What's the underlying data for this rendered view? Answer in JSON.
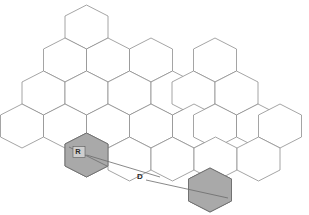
{
  "diagram": {
    "type": "cellular-frequency-reuse-hexagon-grid",
    "background_color": "#ffffff",
    "cell_outline_color": "#8e8e8e",
    "shaded_cell_color": "#a9a9a9",
    "line_color": "#6b6b6b",
    "geometry": {
      "hex_width": 43,
      "hex_height": 44,
      "column_pitch": 43,
      "row_pitch": 33,
      "row_offset": 21.5,
      "orientation": "pointy-top"
    },
    "labels": [
      {
        "id": "radius",
        "text": "R",
        "x": 78,
        "y": 152,
        "boxed": true
      },
      {
        "id": "distance",
        "text": "D",
        "x": 140,
        "y": 177,
        "boxed": false
      }
    ],
    "shaded_cells": [
      {
        "id": "reference-cell",
        "label": "R",
        "cx": 86.5,
        "cy": 155
      },
      {
        "id": "cochannel-cell",
        "label": "",
        "cx": 210,
        "cy": 190
      }
    ],
    "lines": [
      {
        "id": "radius-line",
        "name": "cell-radius-line",
        "x1": 69,
        "y1": 147,
        "x2": 107,
        "y2": 166
      },
      {
        "id": "distance-line-upper",
        "name": "reuse-distance-line-upper",
        "x1": 86.5,
        "y1": 155,
        "x2": 160,
        "y2": 177
      },
      {
        "id": "distance-line-lower",
        "name": "reuse-distance-line-lower",
        "x1": 146,
        "y1": 180,
        "x2": 228,
        "y2": 198
      }
    ],
    "cells": [
      {
        "cx": 86.5,
        "cy": 27
      },
      {
        "cx": 65,
        "cy": 60
      },
      {
        "cx": 108,
        "cy": 60
      },
      {
        "cx": 151,
        "cy": 60
      },
      {
        "cx": 215,
        "cy": 60
      },
      {
        "cx": 43.5,
        "cy": 93
      },
      {
        "cx": 86.5,
        "cy": 93
      },
      {
        "cx": 129.5,
        "cy": 93
      },
      {
        "cx": 172.5,
        "cy": 93
      },
      {
        "cx": 193.5,
        "cy": 93
      },
      {
        "cx": 236.5,
        "cy": 93
      },
      {
        "cx": 22,
        "cy": 126
      },
      {
        "cx": 65,
        "cy": 126
      },
      {
        "cx": 108,
        "cy": 126
      },
      {
        "cx": 151,
        "cy": 126
      },
      {
        "cx": 194,
        "cy": 126
      },
      {
        "cx": 215,
        "cy": 126
      },
      {
        "cx": 258,
        "cy": 126
      },
      {
        "cx": 280,
        "cy": 126
      },
      {
        "cx": 86.5,
        "cy": 155
      },
      {
        "cx": 129.5,
        "cy": 159
      },
      {
        "cx": 172.5,
        "cy": 159
      },
      {
        "cx": 215.5,
        "cy": 159
      },
      {
        "cx": 258.5,
        "cy": 159
      },
      {
        "cx": 210,
        "cy": 190
      }
    ]
  }
}
